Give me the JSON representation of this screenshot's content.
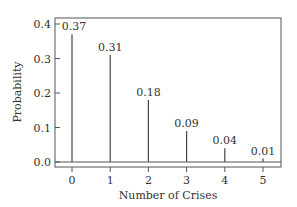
{
  "chart_data": {
    "type": "bar",
    "title": "",
    "xlabel": "Number of Crises",
    "ylabel": "Probability",
    "categories": [
      "0",
      "1",
      "2",
      "3",
      "4",
      "5"
    ],
    "values": [
      0.37,
      0.31,
      0.18,
      0.09,
      0.04,
      0.01
    ],
    "data_labels": [
      "0.37",
      "0.31",
      "0.18",
      "0.09",
      "0.04",
      "0.01"
    ],
    "yticks": [
      "0.0",
      "0.1",
      "0.2",
      "0.3",
      "0.4"
    ],
    "ylim": [
      0,
      0.4
    ],
    "grid": false,
    "legend": null,
    "style": "stem"
  }
}
